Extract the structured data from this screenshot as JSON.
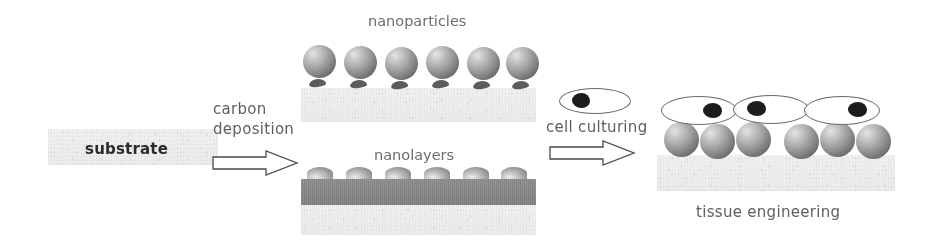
{
  "diagram": {
    "title_text_present": false,
    "stages": [
      {
        "id": "substrate",
        "label": "substrate",
        "label_style": "bold-dark"
      },
      {
        "id": "carbon-deposition",
        "label_line1": "carbon",
        "label_line2": "deposition",
        "arrow": "right-arrow"
      },
      {
        "id": "nanoparticles",
        "label": "nanoparticles",
        "count": 6
      },
      {
        "id": "nanolayers",
        "label": "nanolayers",
        "bump_count": 6
      },
      {
        "id": "cell-culturing",
        "label": "cell culturing",
        "arrow": "right-arrow",
        "cell_count": 1
      },
      {
        "id": "tissue-engineering",
        "label": "tissue engineering",
        "cell_count": 3,
        "sphere_count": 6
      }
    ],
    "colors": {
      "background": "#ffffff",
      "substrate_light": "#eeeeee",
      "nanolayer_bar": "#858585",
      "sphere_dark": "#555555",
      "sphere_light": "#e9e9e9",
      "nucleus": "#1c1c1c",
      "outline": "#4a4a4a",
      "label_gray": "#6e6e6e",
      "label_dark": "#2b2b2b"
    }
  },
  "nanoparticles": {
    "spheres": [
      {
        "x": 303,
        "y": 45,
        "d": 33
      },
      {
        "x": 344,
        "y": 46,
        "d": 33
      },
      {
        "x": 385,
        "y": 47,
        "d": 33
      },
      {
        "x": 426,
        "y": 46,
        "d": 33
      },
      {
        "x": 467,
        "y": 47,
        "d": 33
      },
      {
        "x": 506,
        "y": 47,
        "d": 33
      }
    ]
  },
  "nanolayers": {
    "bumps": [
      {
        "x": 307,
        "y": 167,
        "w": 26,
        "h": 13
      },
      {
        "x": 346,
        "y": 167,
        "w": 26,
        "h": 13
      },
      {
        "x": 385,
        "y": 167,
        "w": 26,
        "h": 13
      },
      {
        "x": 424,
        "y": 167,
        "w": 26,
        "h": 13
      },
      {
        "x": 463,
        "y": 167,
        "w": 26,
        "h": 13
      },
      {
        "x": 501,
        "y": 167,
        "w": 26,
        "h": 13
      }
    ]
  },
  "tissue": {
    "spheres": [
      {
        "x": 664,
        "y": 122,
        "d": 35
      },
      {
        "x": 700,
        "y": 124,
        "d": 35
      },
      {
        "x": 736,
        "y": 122,
        "d": 35
      },
      {
        "x": 784,
        "y": 124,
        "d": 35
      },
      {
        "x": 820,
        "y": 122,
        "d": 35
      },
      {
        "x": 856,
        "y": 124,
        "d": 35
      }
    ],
    "cells": [
      {
        "x": 661,
        "y": 96,
        "w": 76,
        "h": 29,
        "nucleus_dx": 42,
        "nucleus_dy": 7,
        "nucleus_w": 19,
        "nucleus_h": 15
      },
      {
        "x": 733,
        "y": 95,
        "w": 76,
        "h": 29,
        "nucleus_dx": 14,
        "nucleus_dy": 6,
        "nucleus_w": 19,
        "nucleus_h": 15
      },
      {
        "x": 804,
        "y": 96,
        "w": 76,
        "h": 29,
        "nucleus_dx": 44,
        "nucleus_dy": 6,
        "nucleus_w": 19,
        "nucleus_h": 15
      }
    ]
  },
  "culture_cell": {
    "x": 559,
    "y": 88,
    "w": 72,
    "h": 26,
    "nucleus_dx": 13,
    "nucleus_dy": 5,
    "nucleus_w": 18,
    "nucleus_h": 15
  }
}
